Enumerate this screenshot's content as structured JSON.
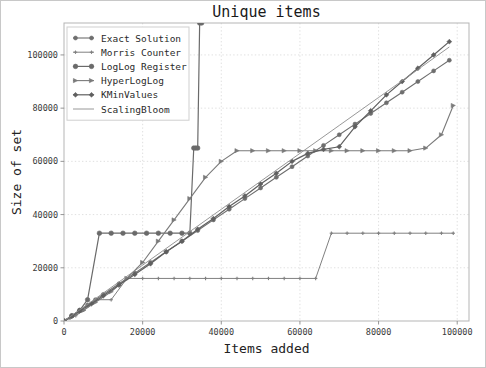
{
  "figure": {
    "width": 486,
    "height": 368,
    "background": "#ffffff",
    "border_color": "#c8c8c8"
  },
  "chart_data": {
    "type": "line",
    "title": "Unique items",
    "xlabel": "Items added",
    "ylabel": "Size of set",
    "xlim": [
      0,
      103000
    ],
    "ylim": [
      0,
      112000
    ],
    "xticks": [
      0,
      20000,
      40000,
      60000,
      80000,
      100000
    ],
    "xticklabels": [
      "0",
      "20000",
      "40000",
      "60000",
      "80000",
      "100000"
    ],
    "yticks": [
      0,
      20000,
      40000,
      60000,
      80000,
      100000
    ],
    "yticklabels": [
      "0",
      "20000",
      "40000",
      "60000",
      "80000",
      "100000"
    ],
    "grid": true,
    "grid_color": "#d8d8d8",
    "legend_position": "upper left",
    "series": [
      {
        "name": "Exact Solution",
        "marker": "circle",
        "color": "#6e6e6e",
        "linewidth": 1.1,
        "markersize": 4.0,
        "x": [
          0,
          2000,
          4000,
          6000,
          8000,
          10000,
          14000,
          18000,
          22000,
          26000,
          30000,
          34000,
          38000,
          42000,
          46000,
          50000,
          54000,
          58000,
          62000,
          66000,
          70000,
          74000,
          78000,
          82000,
          86000,
          90000,
          94000,
          98000
        ],
        "y": [
          0,
          2000,
          4000,
          6000,
          8000,
          10000,
          14000,
          18000,
          22000,
          26000,
          30000,
          34000,
          38000,
          42000,
          46000,
          50000,
          54000,
          58000,
          62000,
          66000,
          70000,
          74000,
          78000,
          82000,
          86000,
          90000,
          94000,
          98000
        ]
      },
      {
        "name": "Morris Counter",
        "marker": "plus",
        "color": "#808080",
        "linewidth": 1.0,
        "markersize": 3.4,
        "x": [
          0,
          1500,
          3000,
          5000,
          8000,
          12000,
          16000,
          20000,
          24000,
          28000,
          32000,
          36000,
          40000,
          44000,
          48000,
          52000,
          56000,
          60000,
          64000,
          68000,
          72000,
          76000,
          80000,
          84000,
          88000,
          92000,
          96000,
          99000
        ],
        "y": [
          0,
          1000,
          2000,
          4000,
          8000,
          8000,
          16000,
          16000,
          16000,
          16000,
          16000,
          16000,
          16000,
          16000,
          16000,
          16000,
          16000,
          16000,
          16000,
          33000,
          33000,
          33000,
          33000,
          33000,
          33000,
          33000,
          33000,
          33000
        ]
      },
      {
        "name": "LogLog Register",
        "marker": "circle-filled",
        "color": "#6a6a6a",
        "linewidth": 1.2,
        "markersize": 4.6,
        "x": [
          0,
          2000,
          4000,
          6000,
          9000,
          12000,
          15000,
          18000,
          21000,
          24000,
          27000,
          30000,
          32000,
          33000,
          33500,
          34000,
          34500,
          35000
        ],
        "y": [
          0,
          2000,
          4000,
          8000,
          33000,
          33000,
          33000,
          33000,
          33000,
          33000,
          33000,
          33000,
          33000,
          65000,
          65000,
          65000,
          112000,
          112000
        ]
      },
      {
        "name": "HyperLogLog",
        "marker": "triangle",
        "color": "#7a7a7a",
        "linewidth": 1.1,
        "markersize": 4.2,
        "x": [
          0,
          2000,
          5000,
          8000,
          12000,
          16000,
          20000,
          24000,
          28000,
          32000,
          36000,
          40000,
          44000,
          48000,
          52000,
          56000,
          60000,
          64000,
          68000,
          72000,
          76000,
          80000,
          84000,
          88000,
          92000,
          96000,
          99000
        ],
        "y": [
          0,
          1500,
          4000,
          7000,
          11000,
          16000,
          22000,
          30000,
          38000,
          46000,
          54000,
          60000,
          64000,
          64000,
          64000,
          64000,
          64000,
          64000,
          64000,
          64000,
          64000,
          64000,
          64000,
          64000,
          65000,
          70000,
          81000
        ]
      },
      {
        "name": "KMinValues",
        "marker": "diamond",
        "color": "#5f5f5f",
        "linewidth": 1.2,
        "markersize": 4.8,
        "x": [
          0,
          2000,
          4000,
          7000,
          10000,
          14000,
          18000,
          22000,
          26000,
          30000,
          34000,
          38000,
          42000,
          46000,
          50000,
          54000,
          58000,
          62000,
          66000,
          70000,
          74000,
          78000,
          82000,
          86000,
          90000,
          94000,
          98000
        ],
        "y": [
          0,
          1800,
          3800,
          6500,
          9500,
          13500,
          17500,
          21500,
          26000,
          30000,
          34500,
          38500,
          43000,
          47000,
          51500,
          55500,
          60000,
          63000,
          64500,
          65500,
          73000,
          79000,
          85000,
          90000,
          95000,
          100000,
          105000
        ]
      },
      {
        "name": "ScalingBloom",
        "marker": "none",
        "color": "#8c8c8c",
        "linewidth": 0.9,
        "markersize": 0,
        "x": [
          0,
          10000,
          20000,
          30000,
          40000,
          50000,
          60000,
          70000,
          80000,
          90000,
          98000
        ],
        "y": [
          0,
          10500,
          21000,
          31500,
          42000,
          52500,
          63000,
          73500,
          84000,
          94500,
          103000
        ]
      }
    ]
  },
  "legend": {
    "items": [
      {
        "label": "Exact Solution"
      },
      {
        "label": "Morris Counter"
      },
      {
        "label": "LogLog Register"
      },
      {
        "label": "HyperLogLog"
      },
      {
        "label": "KMinValues"
      },
      {
        "label": "ScalingBloom"
      }
    ]
  }
}
